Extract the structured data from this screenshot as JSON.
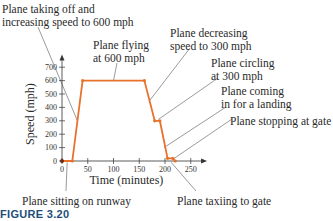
{
  "figure_caption": "FIGURE 3.20",
  "annotations": {
    "takeoff_line1": "Plane taking off and",
    "takeoff_line2": "increasing speed to 600 mph",
    "flying_line1": "Plane flying",
    "flying_line2": "at 600 mph",
    "decreasing_line1": "Plane decreasing",
    "decreasing_line2": "speed to 300 mph",
    "circling_line1": "Plane circling",
    "circling_line2": "at 300 mph",
    "landing_line1": "Plane coming",
    "landing_line2": "in for a landing",
    "stopping": "Plane stopping at gate",
    "runway": "Plane sitting on runway",
    "taxiing": "Plane taxiing to gate"
  },
  "colors": {
    "line": "#e8722c",
    "axis": "#333333",
    "leader": "#555555",
    "caption": "#1e4e7a"
  },
  "chart_data": {
    "type": "line",
    "title": "",
    "xlabel": "Time (minutes)",
    "ylabel": "Speed (mph)",
    "x_ticks": [
      0,
      50,
      100,
      150,
      200,
      250
    ],
    "y_ticks": [
      0,
      100,
      200,
      300,
      400,
      500,
      600,
      700
    ],
    "xlim": [
      0,
      270
    ],
    "ylim": [
      0,
      750
    ],
    "grid": false,
    "legend": "none",
    "series": [
      {
        "name": "Plane speed",
        "x": [
          0,
          20,
          40,
          160,
          180,
          190,
          205,
          215,
          220
        ],
        "y": [
          0,
          0,
          600,
          600,
          300,
          300,
          20,
          20,
          0
        ]
      }
    ],
    "annotations": [
      "Plane taking off and increasing speed to 600 mph",
      "Plane flying at 600 mph",
      "Plane decreasing speed to 300 mph",
      "Plane circling at 300 mph",
      "Plane coming in for a landing",
      "Plane stopping at gate",
      "Plane sitting on runway",
      "Plane taxiing to gate"
    ]
  }
}
